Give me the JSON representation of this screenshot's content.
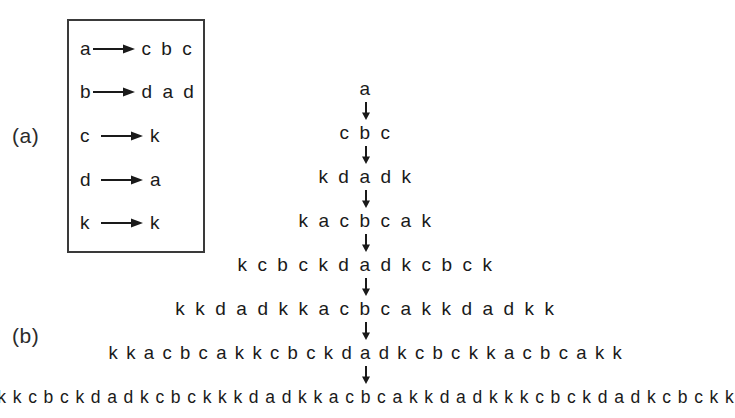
{
  "figure": {
    "panels": [
      {
        "id": "a",
        "label": "(a)",
        "caption_text": "(a)"
      },
      {
        "id": "b",
        "label": "(b)",
        "caption_text": "(b)"
      }
    ]
  },
  "rules": {
    "title": "production-rules",
    "arrow_glyph": "→",
    "items": [
      {
        "lhs": "a",
        "rhs": "c b c"
      },
      {
        "lhs": "b",
        "rhs": "d a d"
      },
      {
        "lhs": "c",
        "rhs": "k"
      },
      {
        "lhs": "d",
        "rhs": "a"
      },
      {
        "lhs": "k",
        "rhs": "k"
      }
    ]
  },
  "derivation": {
    "arrow_glyph": "↓",
    "steps": [
      {
        "index": 0,
        "string": "a",
        "length": 1
      },
      {
        "index": 1,
        "string": "c b c",
        "length": 3
      },
      {
        "index": 2,
        "string": "k d a d k",
        "length": 5
      },
      {
        "index": 3,
        "string": "k a c b c a k",
        "length": 7
      },
      {
        "index": 4,
        "string": "k c b c k d a d k c b c k",
        "length": 13
      },
      {
        "index": 5,
        "string": "k k d a d k k a c b c a k k d a d k k",
        "length": 19
      },
      {
        "index": 6,
        "string": "k k a c b c a k k c b c k d a d k c b c k k a c b c a k k",
        "length": 29
      },
      {
        "index": 7,
        "string": "k k c b c k d a d k c b c k k k d a d k k a c b c a k k d a d k k k c b c k d a d k c b c k k",
        "length": 47
      }
    ]
  },
  "colors": {
    "background": "#ffffff",
    "ink": "#1a1a1a",
    "box_border": "#3a3a3a"
  }
}
